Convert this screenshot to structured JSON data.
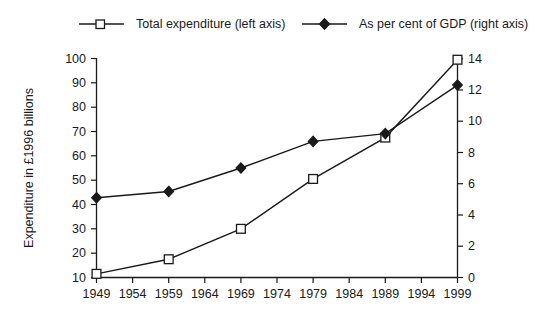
{
  "chart_data": {
    "type": "line",
    "title": "",
    "subtitle": "",
    "xlabel": "",
    "ylabel": "Expenditure in £1996 billions",
    "y2label": "",
    "grid": false,
    "legend_position": "top",
    "x": [
      1949,
      1959,
      1969,
      1979,
      1989,
      1999
    ],
    "xlim": [
      1949,
      1999
    ],
    "x_tick_labels": [
      "1949",
      "1954",
      "1959",
      "1964",
      "1969",
      "1974",
      "1979",
      "1984",
      "1989",
      "1994",
      "1999"
    ],
    "x_ticks": [
      1949,
      1954,
      1959,
      1964,
      1969,
      1974,
      1979,
      1984,
      1989,
      1994,
      1999
    ],
    "ylim": [
      10,
      100
    ],
    "y_ticks": [
      10,
      20,
      30,
      40,
      50,
      60,
      70,
      80,
      90,
      100
    ],
    "y_tick_labels": [
      "10",
      "20",
      "30",
      "40",
      "50",
      "60",
      "70",
      "80",
      "90",
      "100"
    ],
    "y2lim": [
      0,
      14
    ],
    "y2_ticks": [
      0,
      2,
      4,
      6,
      8,
      10,
      12,
      14
    ],
    "y2_tick_labels": [
      "0",
      "2",
      "4",
      "6",
      "8",
      "10",
      "12",
      "14"
    ],
    "series": [
      {
        "name": "Total expenditure (left axis)",
        "axis": "left",
        "marker": "open-square",
        "values": [
          11.5,
          17.5,
          30,
          50.5,
          67.5,
          99.5
        ]
      },
      {
        "name": "As per cent of GDP (right axis)",
        "axis": "right",
        "marker": "filled-diamond",
        "values": [
          5.1,
          5.5,
          7.0,
          8.7,
          9.2,
          12.3
        ]
      }
    ]
  },
  "legend": {
    "items": [
      {
        "label": "Total expenditure (left axis)",
        "marker": "open-square"
      },
      {
        "label": "As per cent of GDP (right axis)",
        "marker": "filled-diamond"
      }
    ]
  },
  "axes": {
    "y_title": "Expenditure in £1996 billions"
  },
  "colors": {
    "ink": "#1a1a1a",
    "background": "#ffffff"
  }
}
